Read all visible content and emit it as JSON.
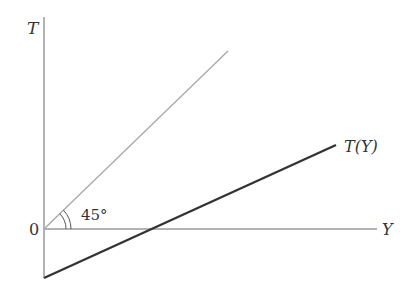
{
  "diagram": {
    "axes": {
      "y_label": "T",
      "x_label": "Y",
      "origin_label": "0"
    },
    "lines": [
      {
        "name": "45-degree-line",
        "label": "",
        "style": "thin",
        "color": "#999999"
      },
      {
        "name": "tax-function",
        "label": "T(Y)",
        "style": "thick",
        "color": "#333333"
      }
    ],
    "angle_annotation": "45°"
  }
}
